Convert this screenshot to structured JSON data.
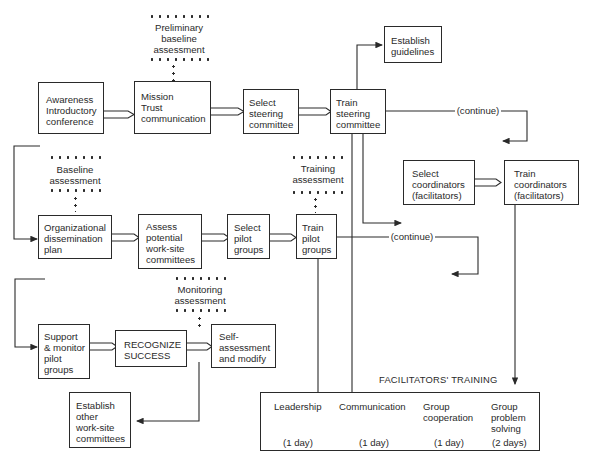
{
  "diagram": {
    "boxes": {
      "awareness": "Awareness\nIntroductory\nconference",
      "mission": "Mission\nTrust\ncommunication",
      "select_steering": "Select\nsteering\ncommittee",
      "train_steering": "Train\nsteering\ncommittee",
      "establish_guidelines": "Establish\nguidelines",
      "select_coordinators": "Select\ncoordinators\n(facilitators)",
      "train_coordinators": "Train\ncoordinators\n(facilitators)",
      "org_dissemination": "Organizational\ndissemination\nplan",
      "assess_committees": "Assess\npotential\nwork-site\ncommittees",
      "select_pilot": "Select\npilot\ngroups",
      "train_pilot": "Train\npilot\ngroups",
      "support_monitor": "Support\n& monitor\npilot\ngroups",
      "recognize_success": "RECOGNIZE\nSUCCESS",
      "self_assessment": "Self-\nassessment\nand modify",
      "establish_other": "Establish\nother\nwork-site\ncommittees"
    },
    "assessments": {
      "preliminary": "Preliminary\nbaseline\nassessment",
      "baseline": "Baseline\nassessment",
      "training": "Training\nassessment",
      "monitoring": "Monitoring\nassessment"
    },
    "connectors": {
      "continue_1": "(continue)",
      "continue_2": "(continue)"
    },
    "facilitators_training": {
      "title": "FACILITATORS' TRAINING",
      "modules": [
        {
          "name": "Leadership",
          "duration": "(1 day)"
        },
        {
          "name": "Communication",
          "duration": "(1 day)"
        },
        {
          "name": "Group\ncooperation",
          "duration": "(1 day)"
        },
        {
          "name": "Group\nproblem\nsolving",
          "duration": "(2 days)"
        }
      ]
    }
  }
}
